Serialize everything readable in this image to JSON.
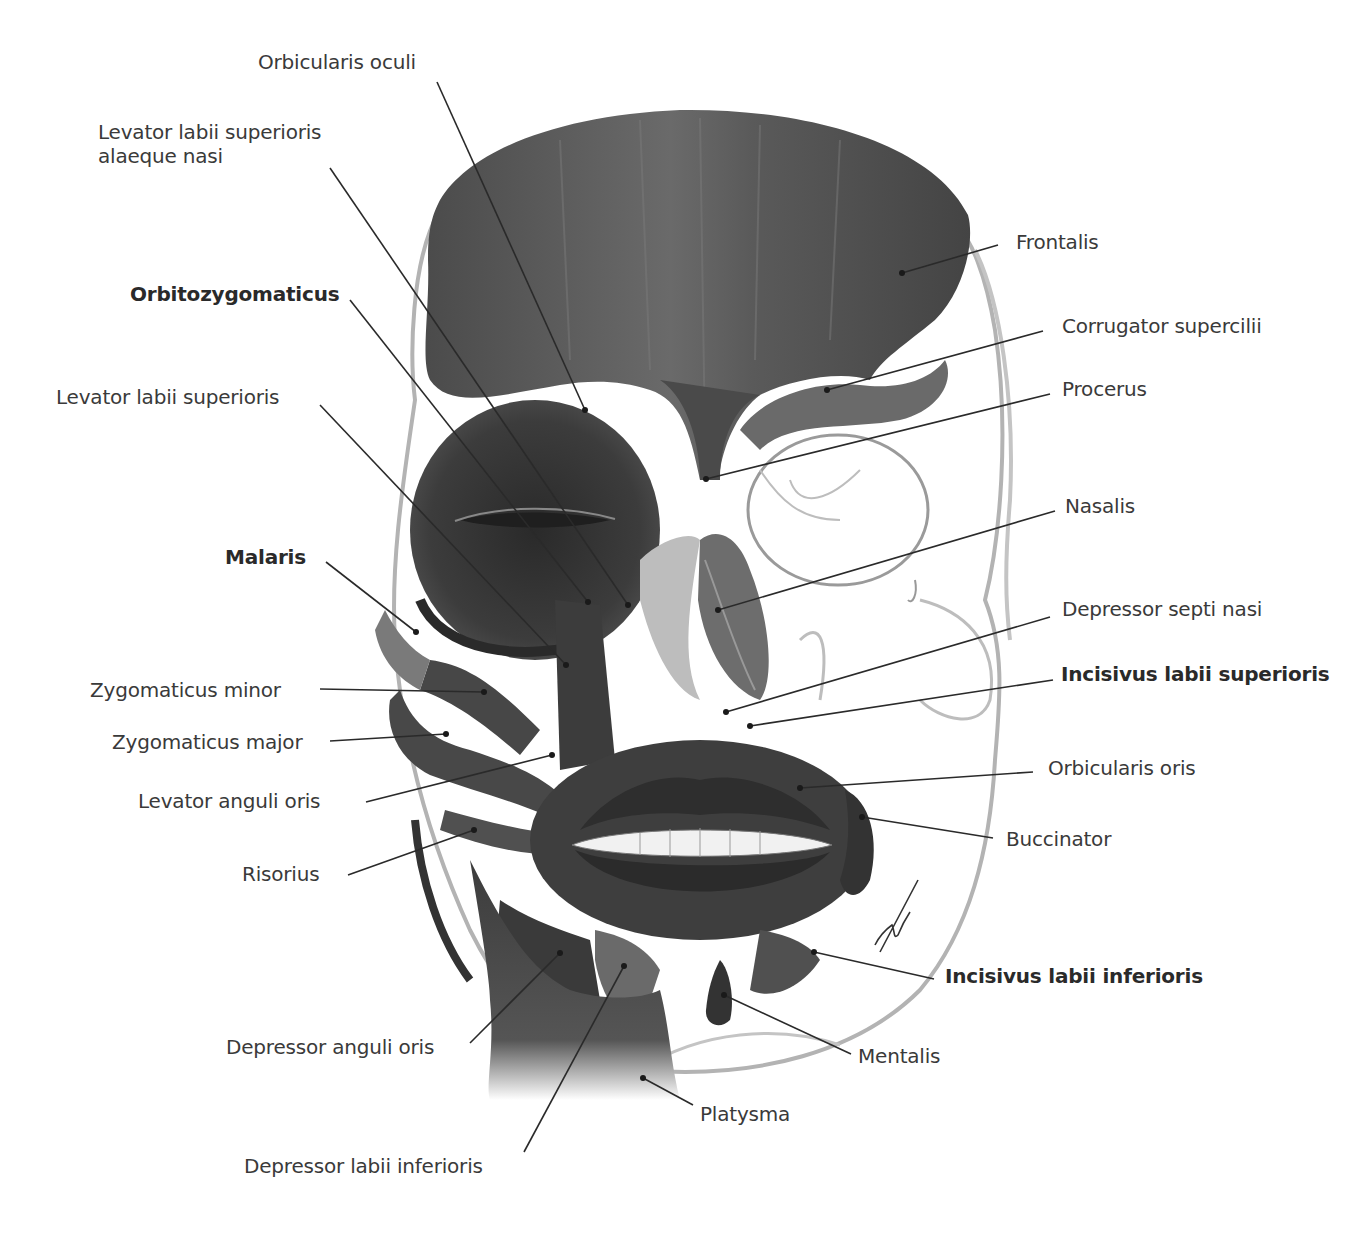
{
  "figure": {
    "signature": "artist signature"
  },
  "labels_left": [
    {
      "id": "orbicularis-oculi",
      "text": "Orbicularis oculi",
      "bold": false,
      "x": 258,
      "y": 50,
      "line": [
        437,
        82,
        585,
        410
      ]
    },
    {
      "id": "levator-labii-superioris-alaeque-nasi",
      "text": "Levator labii superioris",
      "text2": "alaeque nasi",
      "bold": false,
      "x": 98,
      "y": 120,
      "line": [
        330,
        168,
        628,
        605
      ]
    },
    {
      "id": "orbitozygomaticus",
      "text": "Orbitozygomaticus",
      "bold": true,
      "x": 130,
      "y": 282,
      "line": [
        350,
        300,
        588,
        602
      ]
    },
    {
      "id": "levator-labii-superioris",
      "text": "Levator labii superioris",
      "bold": false,
      "x": 56,
      "y": 385,
      "line": [
        320,
        405,
        566,
        665
      ]
    },
    {
      "id": "malaris",
      "text": "Malaris",
      "bold": true,
      "x": 225,
      "y": 545,
      "line": [
        326,
        562,
        416,
        632
      ]
    },
    {
      "id": "zygomaticus-minor",
      "text": "Zygomaticus minor",
      "bold": false,
      "x": 90,
      "y": 678,
      "line": [
        320,
        689,
        484,
        692
      ]
    },
    {
      "id": "zygomaticus-major",
      "text": "Zygomaticus major",
      "bold": false,
      "x": 112,
      "y": 730,
      "line": [
        330,
        741,
        446,
        734
      ]
    },
    {
      "id": "levator-anguli-oris",
      "text": "Levator anguli oris",
      "bold": false,
      "x": 138,
      "y": 789,
      "line": [
        366,
        802,
        552,
        755
      ]
    },
    {
      "id": "risorius",
      "text": "Risorius",
      "bold": false,
      "x": 242,
      "y": 862,
      "line": [
        348,
        875,
        474,
        830
      ]
    },
    {
      "id": "depressor-anguli-oris",
      "text": "Depressor anguli oris",
      "bold": false,
      "x": 226,
      "y": 1035,
      "line": [
        470,
        1043,
        560,
        953
      ]
    },
    {
      "id": "depressor-labii-inferioris",
      "text": "Depressor labii inferioris",
      "bold": false,
      "x": 244,
      "y": 1154,
      "line": [
        524,
        1152,
        624,
        966
      ]
    }
  ],
  "labels_right": [
    {
      "id": "frontalis",
      "text": "Frontalis",
      "bold": false,
      "x": 1016,
      "y": 230,
      "line": [
        998,
        245,
        902,
        273
      ]
    },
    {
      "id": "corrugator-supercilii",
      "text": "Corrugator supercilii",
      "bold": false,
      "x": 1062,
      "y": 314,
      "line": [
        1043,
        331,
        827,
        390
      ]
    },
    {
      "id": "procerus",
      "text": "Procerus",
      "bold": false,
      "x": 1062,
      "y": 377,
      "line": [
        1050,
        394,
        706,
        479
      ]
    },
    {
      "id": "nasalis",
      "text": "Nasalis",
      "bold": false,
      "x": 1065,
      "y": 494,
      "line": [
        1055,
        511,
        718,
        610
      ]
    },
    {
      "id": "depressor-septi-nasi",
      "text": "Depressor septi nasi",
      "bold": false,
      "x": 1062,
      "y": 597,
      "line": [
        1050,
        617,
        726,
        712
      ]
    },
    {
      "id": "incisivus-labii-superioris",
      "text": "Incisivus labii superioris",
      "bold": true,
      "x": 1061,
      "y": 662,
      "line": [
        1053,
        680,
        750,
        726
      ]
    },
    {
      "id": "orbicularis-oris",
      "text": "Orbicularis oris",
      "bold": false,
      "x": 1048,
      "y": 756,
      "line": [
        1033,
        772,
        800,
        788
      ]
    },
    {
      "id": "buccinator",
      "text": "Buccinator",
      "bold": false,
      "x": 1006,
      "y": 827,
      "line": [
        993,
        838,
        862,
        817
      ]
    },
    {
      "id": "incisivus-labii-inferioris",
      "text": "Incisivus labii inferioris",
      "bold": true,
      "x": 945,
      "y": 964,
      "line": [
        934,
        979,
        814,
        952
      ]
    },
    {
      "id": "mentalis",
      "text": "Mentalis",
      "bold": false,
      "x": 858,
      "y": 1044,
      "line": [
        851,
        1054,
        724,
        995
      ]
    },
    {
      "id": "platysma",
      "text": "Platysma",
      "bold": false,
      "x": 700,
      "y": 1102,
      "line": [
        693,
        1105,
        643,
        1078
      ]
    }
  ],
  "colors": {
    "muscle": "#4a4a4a",
    "muscle_dark": "#2b2b2b",
    "muscle_light": "#6e6e6e",
    "bone_outline": "#a8a8a8",
    "label_text": "#3a3a3a",
    "leader_line": "#2a2a2a"
  }
}
